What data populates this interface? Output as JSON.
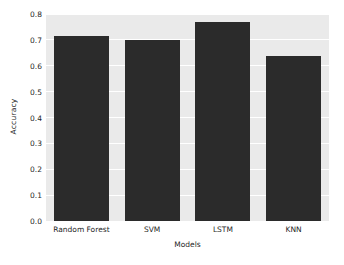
{
  "chart_data": {
    "type": "bar",
    "title": "",
    "subtitle": "",
    "xlabel": "Models",
    "ylabel": "Accuracy",
    "categories": [
      "Random Forest",
      "SVM",
      "LSTM",
      "KNN"
    ],
    "values": [
      0.715,
      0.7,
      0.77,
      0.637
    ],
    "series": [
      {
        "name": "Accuracy",
        "values": [
          0.715,
          0.7,
          0.77,
          0.637
        ]
      }
    ],
    "ylim": [
      0.0,
      0.8
    ],
    "yticks": [
      0.0,
      0.1,
      0.2,
      0.3,
      0.4,
      0.5,
      0.6,
      0.7,
      0.8
    ],
    "ytick_labels": [
      "0.0",
      "0.1",
      "0.2",
      "0.3",
      "0.4",
      "0.5",
      "0.6",
      "0.7",
      "0.8"
    ],
    "xtick_labels": [
      "Random Forest",
      "SVM",
      "LSTM",
      "KNN"
    ],
    "grid": true,
    "grid_axis": "y",
    "grid_color": "#ffffff",
    "legend": false,
    "legend_position": "none",
    "bar_color": "#2b2b2b",
    "plot_background": "#eaeaea",
    "figure_background": "#ffffff",
    "tick_color": "#262626"
  },
  "axes": {
    "y_title": "Accuracy",
    "x_title": "Models"
  }
}
